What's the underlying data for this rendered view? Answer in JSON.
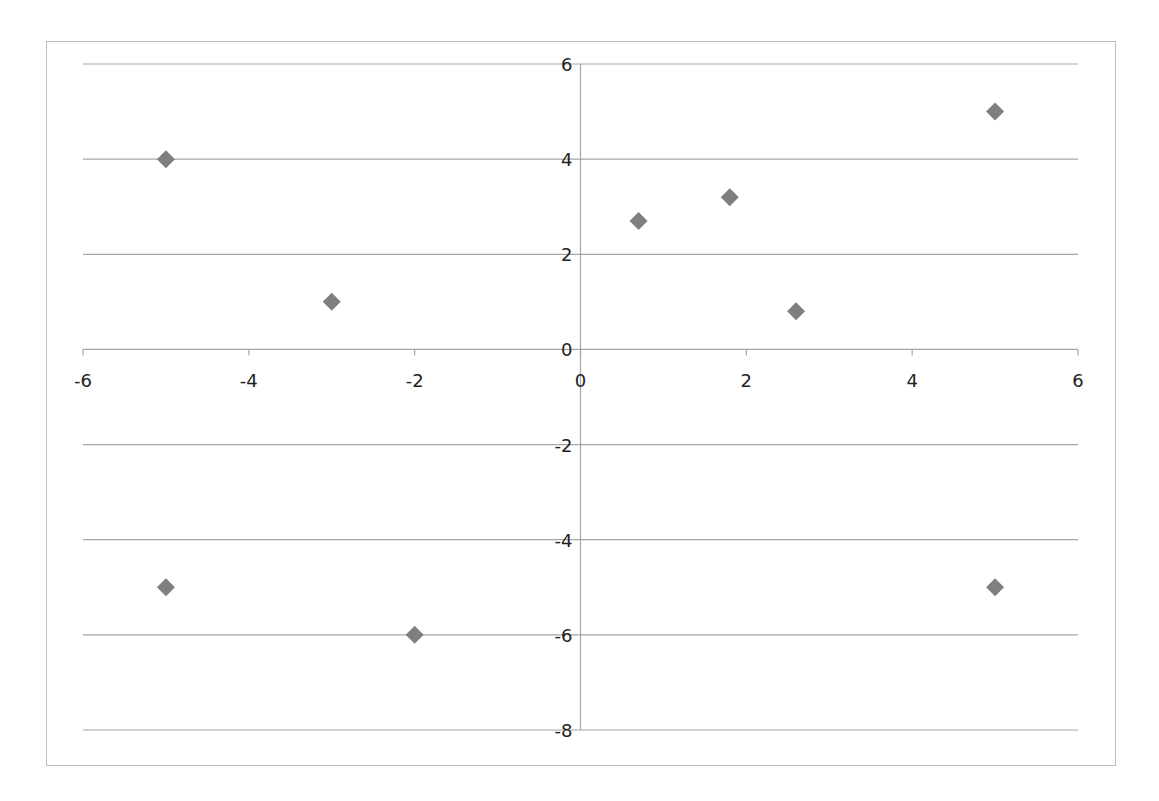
{
  "chart_data": {
    "type": "scatter",
    "title": "",
    "xlabel": "",
    "ylabel": "",
    "xlim": [
      -6,
      6
    ],
    "ylim": [
      -8,
      6
    ],
    "x_ticks": [
      -6,
      -4,
      -2,
      0,
      2,
      4,
      6
    ],
    "y_ticks": [
      -8,
      -6,
      -4,
      -2,
      0,
      2,
      4,
      6
    ],
    "grid": {
      "horizontal": true,
      "vertical": false
    },
    "legend": null,
    "marker": "diamond",
    "marker_color": "#7f7f7f",
    "series": [
      {
        "name": "Series1",
        "points": [
          {
            "x": -5,
            "y": 4
          },
          {
            "x": -3,
            "y": 1
          },
          {
            "x": 0.7,
            "y": 2.7
          },
          {
            "x": 1.8,
            "y": 3.2
          },
          {
            "x": 2.6,
            "y": 0.8
          },
          {
            "x": 5,
            "y": 5
          },
          {
            "x": -5,
            "y": -5
          },
          {
            "x": -2,
            "y": -6
          },
          {
            "x": 5,
            "y": -5
          }
        ]
      }
    ]
  },
  "colors": {
    "gridline": "#a6a6a6",
    "axis": "#a6a6a6",
    "border": "#bdbdbd",
    "text": "#222222",
    "marker": "#7f7f7f"
  }
}
